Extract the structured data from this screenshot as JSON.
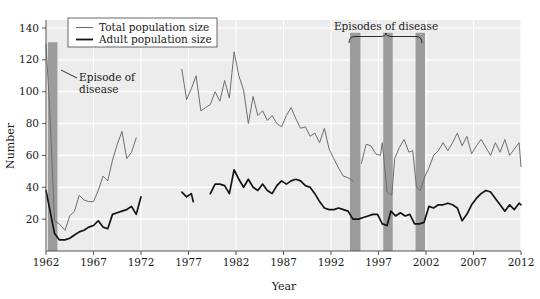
{
  "chart_data": {
    "type": "line",
    "title": "",
    "xlabel": "Year",
    "ylabel": "Number",
    "xlim": [
      1962,
      2012
    ],
    "ylim": [
      0,
      145
    ],
    "xticks": [
      1962,
      1967,
      1972,
      1977,
      1982,
      1987,
      1992,
      1997,
      2002,
      2007,
      2012
    ],
    "yticks": [
      20,
      40,
      60,
      80,
      100,
      120,
      140
    ],
    "grid": true,
    "legend_position": "top-left",
    "legend": [
      {
        "name": "Total population size",
        "color": "#6e6e6e"
      },
      {
        "name": "Adult population size",
        "color": "#141414"
      }
    ],
    "annotations": [
      {
        "text_line1": "Episode of",
        "text_line2": "disease",
        "target_year": 1963
      },
      {
        "text": "Episodes of disease",
        "bracket_years": [
          1994,
          2002
        ]
      }
    ],
    "disease_bands": [
      {
        "start": 1962.2,
        "end": 1963.2,
        "top_value": 131
      },
      {
        "start": 1994.0,
        "end": 1995.1,
        "top_value": 137
      },
      {
        "start": 1997.5,
        "end": 1998.5,
        "top_value": 137
      },
      {
        "start": 2000.9,
        "end": 2001.9,
        "top_value": 137
      }
    ],
    "series": [
      {
        "name": "Total population size",
        "color": "#6e6e6e",
        "segments": [
          {
            "x": [
              1962.0,
              1962.4,
              1962.9,
              1963.4,
              1964.0,
              1964.5,
              1965.0,
              1965.5,
              1966.0,
              1966.5,
              1967.0,
              1967.5,
              1968.0,
              1968.5,
              1969.0,
              1969.5,
              1970.0,
              1970.5,
              1971.0,
              1971.5
            ],
            "y": [
              130,
              88,
              19,
              17,
              13,
              22,
              25,
              35,
              32,
              31,
              31,
              38,
              47,
              44,
              57,
              67,
              75,
              58,
              62,
              71
            ]
          },
          {
            "x": [
              1976.3,
              1976.8,
              1977.3,
              1977.8,
              1978.3,
              1978.8,
              1979.3,
              1979.8,
              1980.3,
              1980.8,
              1981.3,
              1981.8,
              1982.3,
              1982.8,
              1983.3,
              1983.8,
              1984.3,
              1984.8,
              1985.3,
              1985.8,
              1986.3,
              1986.8,
              1987.3,
              1987.8,
              1988.3,
              1988.8,
              1989.3,
              1989.8,
              1990.3,
              1990.8,
              1991.3,
              1991.8,
              1992.3,
              1992.8,
              1993.3,
              1993.8,
              1994.3
            ],
            "y": [
              114,
              95,
              102,
              110,
              88,
              90,
              92,
              100,
              94,
              107,
              96,
              125,
              110,
              101,
              80,
              97,
              85,
              88,
              82,
              85,
              80,
              78,
              85,
              90,
              83,
              77,
              78,
              72,
              74,
              68,
              77,
              64,
              58,
              52,
              47,
              46,
              44
            ]
          },
          {
            "x": [
              1995.2,
              1995.7,
              1996.2,
              1996.7,
              1997.2,
              1997.4,
              1997.9,
              1998.4,
              1998.7,
              1999.2,
              1999.7,
              2000.2,
              2000.6,
              2001.0,
              2001.4,
              2001.9,
              2002.3,
              2002.8,
              2003.3,
              2003.8,
              2004.3,
              2004.8,
              2005.3,
              2005.8,
              2006.3,
              2006.8,
              2007.3,
              2007.8,
              2008.3,
              2008.8,
              2009.3,
              2009.8,
              2010.3,
              2010.8,
              2011.3,
              2011.8,
              2012.0
            ],
            "y": [
              55,
              67,
              66,
              61,
              60,
              68,
              37,
              35,
              58,
              65,
              70,
              62,
              63,
              40,
              38,
              47,
              52,
              60,
              63,
              68,
              63,
              68,
              74,
              66,
              72,
              61,
              66,
              70,
              65,
              60,
              68,
              62,
              70,
              60,
              64,
              68,
              53
            ]
          }
        ]
      },
      {
        "name": "Adult population size",
        "color": "#141414",
        "segments": [
          {
            "x": [
              1962.0,
              1962.4,
              1962.9,
              1963.4,
              1964.0,
              1964.5,
              1965.0,
              1965.5,
              1966.0,
              1966.5,
              1967.0,
              1967.5,
              1968.0,
              1968.5,
              1969.0,
              1969.5,
              1970.0,
              1970.5,
              1971.0,
              1971.5,
              1972.0
            ],
            "y": [
              38,
              26,
              11,
              7,
              7,
              8,
              10,
              12,
              13,
              15,
              16,
              19,
              15,
              14,
              23,
              24,
              25,
              26,
              28,
              23,
              34
            ]
          },
          {
            "x": [
              1976.3,
              1976.8,
              1977.3,
              1977.5
            ],
            "y": [
              37,
              34,
              36,
              31
            ]
          },
          {
            "x": [
              1979.3,
              1979.8,
              1980.3,
              1980.8,
              1981.3,
              1981.8,
              1982.3,
              1982.8,
              1983.3,
              1983.8,
              1984.3,
              1984.8,
              1985.3,
              1985.8,
              1986.3,
              1986.8,
              1987.3,
              1987.8,
              1988.3,
              1988.8,
              1989.3,
              1989.8,
              1990.3,
              1990.8,
              1991.3,
              1991.8,
              1992.3,
              1992.8,
              1993.3,
              1993.8,
              1994.3,
              1994.9,
              1995.4,
              1995.9,
              1996.4,
              1996.9,
              1997.4,
              1997.9,
              1998.3,
              1998.8,
              1999.3,
              1999.8,
              2000.3,
              2000.8,
              2001.3,
              2001.8,
              2002.3,
              2002.8,
              2003.3,
              2003.8,
              2004.3,
              2004.8,
              2005.3,
              2005.8,
              2006.3,
              2006.8,
              2007.3,
              2007.8,
              2008.3,
              2008.8,
              2009.3,
              2009.8,
              2010.3,
              2010.8,
              2011.3,
              2011.8,
              2012.0
            ],
            "y": [
              36,
              42,
              42,
              41,
              36,
              51,
              45,
              40,
              45,
              40,
              38,
              42,
              38,
              36,
              41,
              44,
              42,
              44,
              45,
              44,
              41,
              40,
              36,
              31,
              27,
              26,
              26,
              27,
              26,
              25,
              20,
              20,
              21,
              22,
              23,
              23,
              17,
              16,
              25,
              22,
              24,
              22,
              23,
              17,
              17,
              18,
              28,
              27,
              29,
              29,
              30,
              29,
              27,
              19,
              23,
              29,
              33,
              36,
              38,
              37,
              33,
              29,
              25,
              29,
              26,
              30,
              29
            ]
          }
        ]
      }
    ]
  },
  "legend": {
    "item1": "Total population size",
    "item2": "Adult population size"
  },
  "annotations": {
    "episode_line1": "Episode of",
    "episode_line2": "disease",
    "episodes": "Episodes of disease"
  },
  "axes": {
    "xlabel": "Year",
    "ylabel": "Number",
    "xticks": [
      "1962",
      "1967",
      "1972",
      "1977",
      "1982",
      "1987",
      "1992",
      "1997",
      "2002",
      "2007",
      "2012"
    ],
    "yticks": [
      "140",
      "120",
      "100",
      "80",
      "60",
      "40",
      "20"
    ]
  },
  "colors": {
    "plot_background": "#ececed",
    "grid": "#ffffff",
    "band": "#9c9c9c",
    "total_line": "#6e6e6e",
    "adult_line": "#141414",
    "axis": "#555555"
  }
}
